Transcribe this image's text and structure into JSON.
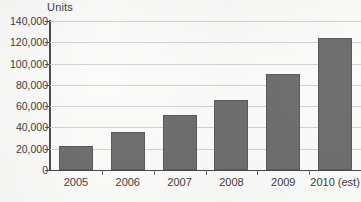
{
  "chart_data": {
    "type": "bar",
    "title": "",
    "subtitle": "",
    "xlabel": "",
    "ylabel": "Units",
    "categories": [
      "2005",
      "2006",
      "2007",
      "2008",
      "2009",
      "2010 (est)"
    ],
    "values": [
      23000,
      36000,
      51500,
      65500,
      90000,
      124000
    ],
    "series": [
      {
        "name": "Units",
        "values": [
          23000,
          36000,
          51500,
          65500,
          90000,
          124000
        ]
      }
    ],
    "ylim": [
      0,
      140000
    ],
    "ytick_values": [
      0,
      20000,
      40000,
      60000,
      80000,
      100000,
      120000,
      140000
    ],
    "ytick_labels": [
      "0",
      "20,000",
      "40,000",
      "60,000",
      "80,000",
      "100,000",
      "120,000",
      "140,000"
    ],
    "grid": true,
    "grid_axis": "y",
    "legend": false,
    "legend_position": "none",
    "bar_color": "#6f6f6f",
    "bar_edge_color": "#5a5a5a",
    "gridline_color": "#d2d2d2",
    "axis_color": "#4c4c4c",
    "text_color": "#3d3d3d",
    "background_color": "#fbfbfa",
    "annotations": []
  }
}
